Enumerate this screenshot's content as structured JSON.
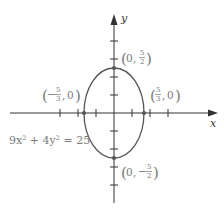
{
  "diagram": {
    "type": "ellipse-graph",
    "equation": "9x² + 4y² = 25",
    "equation_parts": {
      "a": "9x",
      "exp1": "2",
      "mid": " + 4y",
      "exp2": "2",
      "rhs": " = 25"
    },
    "axes": {
      "x_label": "x",
      "y_label": "y"
    },
    "colors": {
      "axis": "#333333",
      "curve": "#555555",
      "label": "#7a7a7a"
    },
    "vertices": [
      {
        "name": "top",
        "x": "0",
        "sign": "",
        "num": "5",
        "den": "2",
        "text": "(0, 5/2)"
      },
      {
        "name": "bottom",
        "x": "0",
        "sign": "−",
        "num": "5",
        "den": "2",
        "text": "(0, −5/2)"
      },
      {
        "name": "left",
        "sign": "−",
        "num": "5",
        "den": "3",
        "y": "0",
        "text": "(−5/3, 0)"
      },
      {
        "name": "right",
        "sign": "",
        "num": "5",
        "den": "3",
        "y": "0",
        "text": "(5/3, 0)"
      }
    ],
    "semi_axes": {
      "horizontal": "5/3",
      "vertical": "5/2"
    }
  }
}
